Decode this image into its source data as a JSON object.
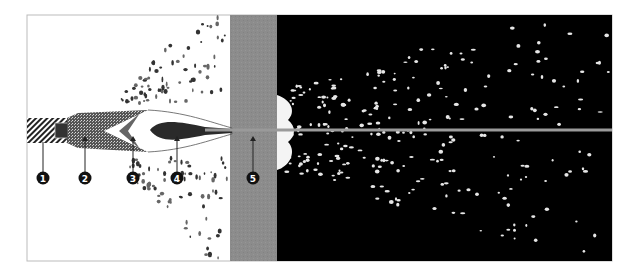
{
  "figure": {
    "colors": {
      "background_left": "#ffffff",
      "armor_plate": "#8c8c8c",
      "background_right": "#000000",
      "jet": "#9a9a9a",
      "marker_fill": "#111111",
      "marker_text": "#ffffff"
    },
    "callouts": [
      {
        "number": "1",
        "label": "❶"
      },
      {
        "number": "2",
        "label": "❷"
      },
      {
        "number": "3",
        "label": "❸"
      },
      {
        "number": "4",
        "label": "❹"
      },
      {
        "number": "5",
        "label": "❺"
      }
    ]
  }
}
